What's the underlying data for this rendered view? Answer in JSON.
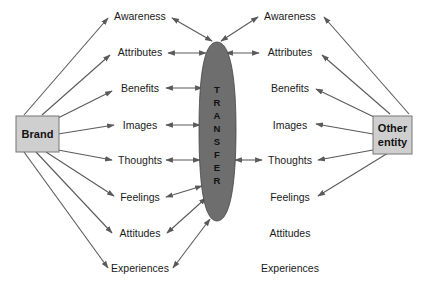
{
  "diagram": {
    "left_box": {
      "label": "Brand",
      "fill": "#cfcfcf"
    },
    "right_box": {
      "label_line1": "Other",
      "label_line2": "entity",
      "fill": "#cfcfcf"
    },
    "transfer": {
      "letters": [
        "T",
        "R",
        "A",
        "N",
        "S",
        "F",
        "E",
        "R"
      ],
      "fill": "#6e6e6e",
      "text": "TRANSFER"
    },
    "left_items": [
      "Awareness",
      "Attributes",
      "Benefits",
      "Images",
      "Thoughts",
      "Feelings",
      "Attitudes",
      "Experiences"
    ],
    "right_items": [
      "Awareness",
      "Attributes",
      "Benefits",
      "Images",
      "Thoughts",
      "Feelings",
      "Attitudes",
      "Experiences"
    ],
    "colors": {
      "line": "#5a5a5a",
      "text": "#1a1a1a"
    }
  }
}
